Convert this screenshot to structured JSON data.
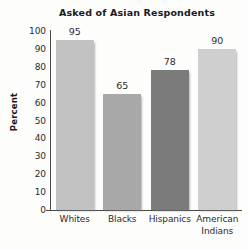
{
  "chart_data": {
    "type": "bar",
    "title": "Asked of Asian Respondents",
    "xlabel": "",
    "ylabel": "Percent",
    "ylim": [
      0,
      100
    ],
    "yticks": [
      100,
      90,
      80,
      70,
      60,
      50,
      40,
      30,
      20,
      10,
      0
    ],
    "grid": false,
    "legend": "none",
    "categories": [
      "Whites",
      "Blacks",
      "Hispanics",
      "American Indians"
    ],
    "values": [
      95,
      65,
      78,
      90
    ],
    "value_labels": [
      "95",
      "65",
      "78",
      "90"
    ],
    "bar_colors": [
      "#c2c2c2",
      "#a8a8a8",
      "#7b7b7b",
      "#cfcfcf"
    ],
    "category_lines": [
      [
        "Whites"
      ],
      [
        "Blacks"
      ],
      [
        "Hispanics"
      ],
      [
        "American",
        "Indians"
      ]
    ]
  },
  "figure": {
    "background_color": "#fdfdfc",
    "axis_color": "#4a4a4a",
    "text_color": "#2b2b2b"
  }
}
